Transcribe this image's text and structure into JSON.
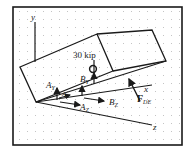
{
  "figure": {
    "type": "free-body diagram",
    "colors": {
      "line": "#1a1a1a",
      "grid": "#b8b8b8",
      "background": "#ffffff"
    }
  },
  "labels": {
    "load": "30 kip",
    "axis_y": "y",
    "axis_x": "x",
    "axis_z": "z",
    "Ay_main": "A",
    "Ay_sub": "Y",
    "By_main": "B",
    "By_sub": "Y",
    "Az_main": "A",
    "Az_sub": "Z",
    "Bz_main": "B",
    "Bz_sub": "Z",
    "Ax_main": "A",
    "Ax_sub": "X",
    "Fde_main": "F",
    "Fde_sub": "DE"
  }
}
